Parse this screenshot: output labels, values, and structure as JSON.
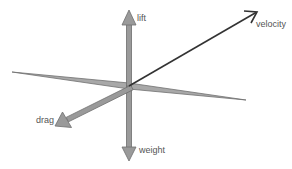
{
  "diagram": {
    "labels": {
      "lift": "lift",
      "velocity": "velocity",
      "drag": "drag",
      "weight": "weight"
    },
    "colors": {
      "arrow_fill": "#9a9a9a",
      "arrow_stroke": "#6e6e6e",
      "velocity": "#333333",
      "wing_fill": "#a8a8a8",
      "wing_stroke": "#707070",
      "label": "#555555"
    },
    "vectors": [
      {
        "name": "lift",
        "from": [
          129,
          86
        ],
        "to": [
          129,
          10
        ]
      },
      {
        "name": "weight",
        "from": [
          129,
          86
        ],
        "to": [
          129,
          161
        ]
      },
      {
        "name": "velocity",
        "from": [
          129,
          86
        ],
        "to": [
          257,
          12
        ]
      },
      {
        "name": "drag",
        "from": [
          132,
          88
        ],
        "to": [
          55,
          126
        ]
      }
    ]
  }
}
